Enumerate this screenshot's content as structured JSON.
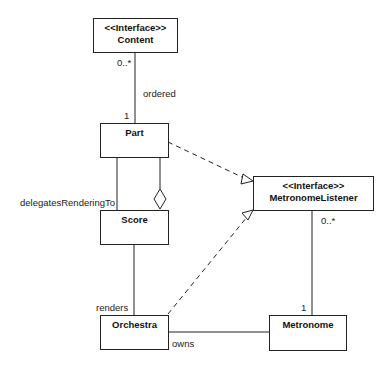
{
  "classes": {
    "content": {
      "stereotype": "<<Interface>>",
      "name": "Content"
    },
    "part": {
      "name": "Part"
    },
    "score": {
      "name": "Score"
    },
    "metronome_listener": {
      "stereotype": "<<Interface>>",
      "name": "MetronomeListener"
    },
    "orchestra": {
      "name": "Orchestra"
    },
    "metronome": {
      "name": "Metronome"
    }
  },
  "labels": {
    "content_mult": "0..*",
    "ordered": "ordered",
    "part_mult": "1",
    "delegates": "delegatesRenderingTo",
    "listener_mult": "0..*",
    "renders": "renders",
    "metronome_mult": "1",
    "owns": "owns"
  }
}
